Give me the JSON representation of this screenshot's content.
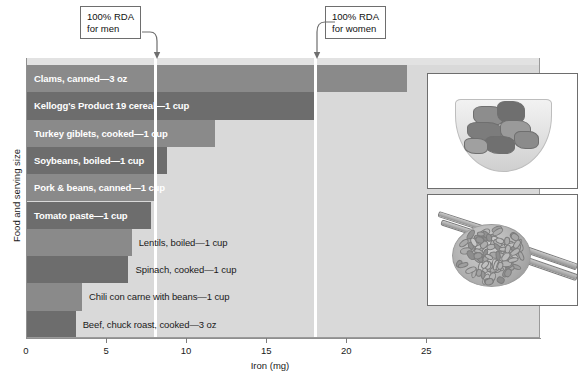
{
  "chart_data": {
    "type": "bar",
    "orientation": "horizontal",
    "title": "",
    "xlabel": "Iron (mg)",
    "ylabel": "Food and serving size",
    "xlim": [
      0,
      32.1
    ],
    "xticks": [
      0,
      5,
      10,
      15,
      20,
      25
    ],
    "xtick_labels": [
      "0",
      "5",
      "10",
      "15",
      "20",
      "25"
    ],
    "grid": false,
    "legend": "none",
    "categories": [
      "Clams, canned—3 oz",
      "Kellogg's Product 19 cereal—1 cup",
      "Turkey giblets, cooked—1 cup",
      "Soybeans, boiled—1 cup",
      "Pork & beans, canned—1 cup",
      "Tomato paste—1 cup",
      "Lentils, boiled—1 cup",
      "Spinach, cooked—1 cup",
      "Chili con carne with beans—1 cup",
      "Beef, chuck roast, cooked—3 oz"
    ],
    "values": [
      23.8,
      18.0,
      11.8,
      8.8,
      8.2,
      7.8,
      6.6,
      6.4,
      3.5,
      3.1
    ],
    "label_placement": [
      "inside",
      "inside",
      "inside",
      "inside",
      "inside",
      "inside",
      "outside",
      "outside",
      "outside",
      "outside"
    ],
    "bar_shades": [
      "light",
      "dark",
      "light",
      "dark",
      "light",
      "dark",
      "light",
      "dark",
      "light",
      "dark"
    ],
    "annotations": [
      {
        "id": "rda-men",
        "text_line1": "100% RDA",
        "text_line2": "for men",
        "value": 8.1
      },
      {
        "id": "rda-women",
        "text_line1": "100% RDA",
        "text_line2": "for women",
        "value": 18.1
      }
    ]
  },
  "colors": {
    "plot_background": "#d9d9d9",
    "bar_light": "#8a8a8a",
    "bar_dark": "#6d6d6d",
    "rda_line": "#ffffff",
    "axis": "#8f8f8f",
    "text": "#1a1a1a",
    "inside_label_text": "#ffffff"
  },
  "photos": [
    {
      "id": "cereal-bowl-photo",
      "caption": ""
    },
    {
      "id": "beans-measuring-cup-photo",
      "caption": ""
    }
  ]
}
